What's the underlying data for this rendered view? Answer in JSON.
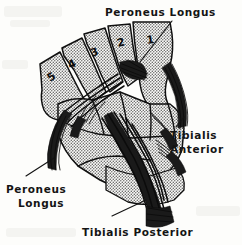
{
  "figure": {
    "title_label": "Peroneus Longus",
    "kind": "anatomical-illustration",
    "background_color": "#fdfdfb",
    "ink_color": "#111111",
    "bone_shading": "halftone-stipple"
  },
  "labels": {
    "top": {
      "text": "Peroneus Longus",
      "lines": [
        "Peroneus Longus"
      ],
      "position": "top-center-right"
    },
    "right": {
      "text": "Tibialis Anterior",
      "lines": [
        "Tibialis",
        "Anterior"
      ],
      "position": "right"
    },
    "bottom_left": {
      "text": "Peroneus Longus",
      "lines": [
        "Peroneus",
        "Longus"
      ],
      "position": "lower-left"
    },
    "bottom": {
      "text": "Tibialis Posterior",
      "lines": [
        "Tibialis Posterior"
      ],
      "position": "bottom-center"
    }
  },
  "metatarsals": [
    {
      "number": "1",
      "x": 147,
      "y": 44
    },
    {
      "number": "2",
      "x": 118,
      "y": 47
    },
    {
      "number": "3",
      "x": 92,
      "y": 57
    },
    {
      "number": "4",
      "x": 70,
      "y": 69
    },
    {
      "number": "5",
      "x": 50,
      "y": 82
    }
  ],
  "leaders": [
    {
      "name": "top-leader",
      "from": "Peroneus Longus label",
      "to": "base of first metatarsal"
    },
    {
      "name": "right-leader",
      "from": "Tibialis Anterior label",
      "to": "tendon on dorsum"
    },
    {
      "name": "bottom-left-leader",
      "from": "Peroneus Longus label",
      "to": "peroneal tendon at cuboid"
    },
    {
      "name": "bottom-leader",
      "from": "Tibialis Posterior label",
      "to": "posterior tendon bundle"
    }
  ]
}
